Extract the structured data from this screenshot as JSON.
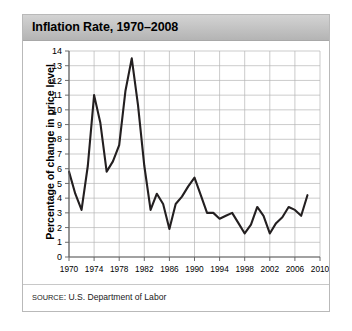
{
  "figure": {
    "title": "Inflation Rate, 1970–2008",
    "source_prefix": "Source",
    "source_rest": ": U.S. Department of Labor",
    "source_full": "SOURCE: U.S. Department of Labor"
  },
  "colors": {
    "title_bar": "#c2c2c2",
    "line": "#231f20",
    "grid": "#b5b5b5",
    "axis": "#6d6d6d",
    "panel": "#ffffff",
    "border": "#b9b9b9"
  },
  "chart_data": {
    "type": "line",
    "title": "Inflation Rate, 1970–2008",
    "xlabel": "",
    "ylabel": "Percentage of change in price level",
    "xlim": [
      1970,
      2010
    ],
    "ylim": [
      0,
      14
    ],
    "xticks": [
      1970,
      1974,
      1978,
      1982,
      1986,
      1990,
      1994,
      1998,
      2002,
      2006,
      2010
    ],
    "yticks": [
      0,
      1,
      2,
      3,
      4,
      5,
      6,
      7,
      8,
      9,
      10,
      11,
      12,
      13,
      14
    ],
    "grid": true,
    "legend": null,
    "series": [
      {
        "name": "Inflation rate",
        "x": [
          1970,
          1971,
          1972,
          1973,
          1974,
          1975,
          1976,
          1977,
          1978,
          1979,
          1980,
          1981,
          1982,
          1983,
          1984,
          1985,
          1986,
          1987,
          1988,
          1989,
          1990,
          1991,
          1992,
          1993,
          1994,
          1995,
          1996,
          1997,
          1998,
          1999,
          2000,
          2001,
          2002,
          2003,
          2004,
          2005,
          2006,
          2007,
          2008
        ],
        "values": [
          5.8,
          4.3,
          3.2,
          6.2,
          11.0,
          9.1,
          5.8,
          6.5,
          7.6,
          11.3,
          13.5,
          10.3,
          6.2,
          3.2,
          4.3,
          3.6,
          1.9,
          3.6,
          4.1,
          4.8,
          5.4,
          4.2,
          3.0,
          3.0,
          2.6,
          2.8,
          3.0,
          2.3,
          1.6,
          2.2,
          3.4,
          2.8,
          1.6,
          2.3,
          2.7,
          3.4,
          3.2,
          2.8,
          4.2
        ]
      }
    ]
  }
}
